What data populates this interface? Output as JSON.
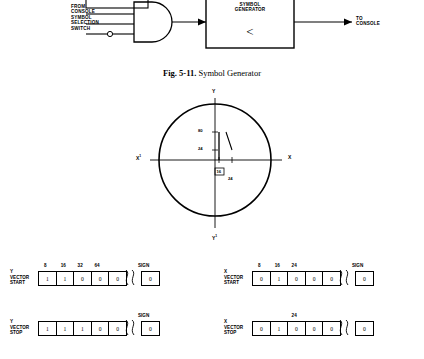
{
  "top_diagram": {
    "input_label": "FROM\nCONSOLE\nSYMBOL\nSELECTION\nSWITCH",
    "input_lines": [
      "FROM",
      "CONSOLE",
      "SYMBOL",
      "SELECTION",
      "SWITCH"
    ],
    "gate_name": "and-gate",
    "box_label_lines": [
      "SYMBOL",
      "GENERATOR"
    ],
    "box_glyph": "<",
    "output_lines": [
      "TO",
      "CONSOLE"
    ]
  },
  "figure_caption": {
    "number": "Fig. 5-11.",
    "title": "Symbol Generator"
  },
  "scope": {
    "axis_labels": {
      "top": "Y",
      "bottom": "Y",
      "left": "X",
      "right": "X",
      "left_sup": "1",
      "bottom_sup": "1"
    },
    "tick_labels": {
      "y_upper": "80",
      "y_lower": "24",
      "x_lower_boxed": "16",
      "x_lower": "24"
    }
  },
  "registers": [
    {
      "name_lines": [
        "Y",
        "VECTOR",
        "START"
      ],
      "headers": [
        {
          "label": "8",
          "cell": 0
        },
        {
          "label": "16",
          "cell": 1
        },
        {
          "label": "32",
          "cell": 2
        },
        {
          "label": "64",
          "cell": 3
        }
      ],
      "bits": [
        "1",
        "1",
        "0",
        "0",
        "0"
      ],
      "sign_header": "SIGN",
      "sign_bit": "0"
    },
    {
      "name_lines": [
        "X",
        "VECTOR",
        "START"
      ],
      "headers": [
        {
          "label": "8",
          "cell": 0
        },
        {
          "label": "16",
          "cell": 1
        },
        {
          "label": "24",
          "cell": 2
        }
      ],
      "bits": [
        "0",
        "1",
        "0",
        "0",
        "0"
      ],
      "sign_header": "SIGN",
      "sign_bit": "0"
    },
    {
      "name_lines": [
        "Y",
        "VECTOR",
        "STOP"
      ],
      "headers": [],
      "bits": [
        "1",
        "1",
        "1",
        "0",
        "0"
      ],
      "sign_header": "SIGN",
      "sign_bit": "0"
    },
    {
      "name_lines": [
        "X",
        "VECTOR",
        "STOP"
      ],
      "headers": [
        {
          "label": "24",
          "cell": 2
        }
      ],
      "bits": [
        "0",
        "1",
        "0",
        "0",
        "0"
      ],
      "sign_header": "",
      "sign_bit": "0"
    }
  ]
}
